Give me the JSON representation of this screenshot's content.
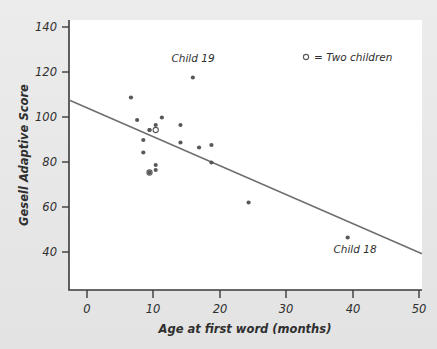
{
  "chart_data": {
    "type": "scatter",
    "title": "",
    "xlabel": "Age at first word (months)",
    "ylabel": "Gesell Adaptive Score",
    "xlim": [
      -3,
      54
    ],
    "ylim": [
      36,
      144
    ],
    "xticks": [
      0,
      10,
      20,
      30,
      40,
      50
    ],
    "yticks": [
      40,
      60,
      80,
      100,
      120,
      140
    ],
    "xticklabels": [
      "0",
      "10",
      "20",
      "30",
      "40",
      "50"
    ],
    "yticklabels": [
      "40",
      "60",
      "80",
      "100",
      "120",
      "140"
    ],
    "grid": false,
    "legend_position": "top-right",
    "legend": [
      {
        "marker": "open-circle",
        "label": "= Two children"
      }
    ],
    "points": [
      {
        "x": 15,
        "y": 95,
        "marker": "filled"
      },
      {
        "x": 26,
        "y": 71,
        "marker": "filled"
      },
      {
        "x": 10,
        "y": 83,
        "marker": "open",
        "note": "two children"
      },
      {
        "x": 9,
        "y": 91,
        "marker": "filled"
      },
      {
        "x": 15,
        "y": 102,
        "marker": "filled"
      },
      {
        "x": 20,
        "y": 87,
        "marker": "filled"
      },
      {
        "x": 18,
        "y": 93,
        "marker": "filled"
      },
      {
        "x": 11,
        "y": 100,
        "marker": "open",
        "note": "two children"
      },
      {
        "x": 8,
        "y": 104,
        "marker": "filled"
      },
      {
        "x": 20,
        "y": 94,
        "marker": "filled"
      },
      {
        "x": 7,
        "y": 113,
        "marker": "filled"
      },
      {
        "x": 9,
        "y": 96,
        "marker": "filled"
      },
      {
        "x": 10,
        "y": 83,
        "marker": "filled"
      },
      {
        "x": 11,
        "y": 84,
        "marker": "filled"
      },
      {
        "x": 11,
        "y": 102,
        "marker": "filled"
      },
      {
        "x": 10,
        "y": 100,
        "marker": "filled"
      },
      {
        "x": 12,
        "y": 105,
        "marker": "filled"
      },
      {
        "x": 42,
        "y": 57,
        "marker": "filled",
        "label": "Child 18"
      },
      {
        "x": 17,
        "y": 121,
        "marker": "filled",
        "label": "Child 19"
      },
      {
        "x": 11,
        "y": 86,
        "marker": "filled"
      },
      {
        "x": 10,
        "y": 100,
        "marker": "filled"
      }
    ],
    "fit_line": {
      "type": "linear-regression",
      "x_start": -3,
      "y_start": 112,
      "x_end": 54,
      "y_end": 50.5
    },
    "annotations": [
      {
        "text": "Child 19",
        "x": 17,
        "y": 127
      },
      {
        "text": "Child 18",
        "x": 42,
        "y": 51
      }
    ]
  }
}
